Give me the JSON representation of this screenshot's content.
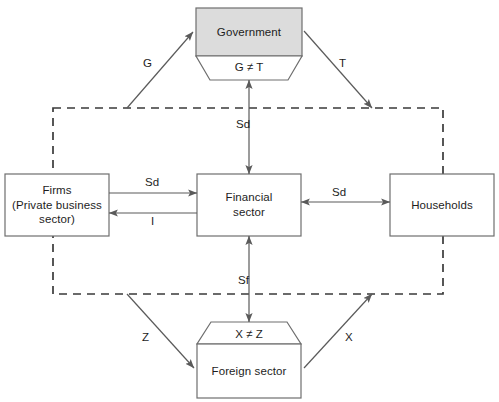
{
  "diagram": {
    "colors": {
      "government_fill": "#dcdcdc",
      "box_fill": "#ffffff",
      "stroke": "#6e6e6e",
      "dashed_stroke": "#3a3a3a",
      "arrow_stroke": "#5a5a5a",
      "text": "#1d1d1d",
      "background": "#ffffff"
    },
    "nodes": [
      {
        "id": "government",
        "label": "Government",
        "filled": true
      },
      {
        "id": "firms",
        "label": "Firms\n(Private business\nsector)",
        "line1": "Firms",
        "line2": "(Private business",
        "line3": "sector)",
        "filled": false
      },
      {
        "id": "financial",
        "label": "Financial sector",
        "line1": "Financial",
        "line2": "sector",
        "filled": false
      },
      {
        "id": "households",
        "label": "Households",
        "filled": false
      },
      {
        "id": "foreign",
        "label": "Foreign sector",
        "filled": false
      }
    ],
    "balance_labels": [
      {
        "id": "government-balance",
        "text": "G ≠ T"
      },
      {
        "id": "foreign-balance",
        "text": "X ≠ Z"
      }
    ],
    "flows": [
      {
        "id": "flow-g",
        "label": "G",
        "from": "boundary",
        "to": "government",
        "direction": "up-right"
      },
      {
        "id": "flow-t",
        "label": "T",
        "from": "government",
        "to": "boundary",
        "direction": "down-right"
      },
      {
        "id": "flow-sd-top",
        "label": "Sd",
        "from": "boundary",
        "to": "financial",
        "direction": "both-vertical"
      },
      {
        "id": "flow-sd-left",
        "label": "Sd",
        "from": "firms",
        "to": "financial",
        "direction": "right"
      },
      {
        "id": "flow-i",
        "label": "I",
        "from": "financial",
        "to": "firms",
        "direction": "left"
      },
      {
        "id": "flow-sd-right",
        "label": "Sd",
        "from": "financial",
        "to": "households",
        "direction": "both-horizontal"
      },
      {
        "id": "flow-sf",
        "label": "Sf",
        "from": "foreign",
        "to": "financial",
        "direction": "both-vertical"
      },
      {
        "id": "flow-z",
        "label": "Z",
        "from": "boundary",
        "to": "foreign",
        "direction": "down-right"
      },
      {
        "id": "flow-x",
        "label": "X",
        "from": "foreign",
        "to": "boundary",
        "direction": "up-right"
      }
    ]
  }
}
